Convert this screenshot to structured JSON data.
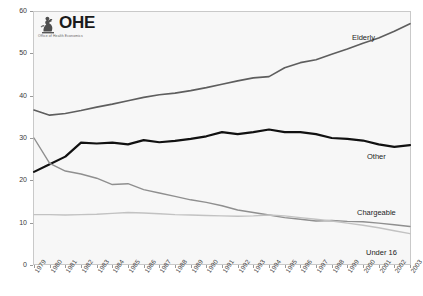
{
  "logo": {
    "wordmark": "OHE",
    "subtitle": "Office of Health Economics",
    "mark_icon": "ohe-crest-icon"
  },
  "chart_data": {
    "type": "line",
    "title": "",
    "subtitle": "",
    "xlabel": "",
    "ylabel": "",
    "ylim": [
      0,
      60
    ],
    "yticks": [
      0,
      10,
      20,
      30,
      40,
      50,
      60
    ],
    "ytick_labels": [
      "0",
      "10",
      "20",
      "30",
      "40",
      "50",
      "60"
    ],
    "grid": false,
    "legend_position": "inline-annotations",
    "categories": [
      "1979",
      "1980",
      "1981",
      "1982",
      "1983",
      "1984",
      "1985",
      "1986",
      "1987",
      "1988",
      "1989",
      "1990",
      "1991",
      "1992",
      "1993",
      "1994",
      "1995",
      "1996",
      "1997",
      "1998",
      "1999",
      "2000",
      "2001",
      "2002",
      "2003"
    ],
    "series": [
      {
        "name": "Elderly",
        "color": "#5e5e5e",
        "width": 1.6,
        "label_text": "Elderly",
        "values": [
          36.6,
          35.4,
          35.8,
          36.5,
          37.3,
          38.0,
          38.8,
          39.6,
          40.2,
          40.6,
          41.2,
          41.9,
          42.7,
          43.5,
          44.2,
          44.5,
          46.6,
          47.8,
          48.5,
          49.8,
          51.0,
          52.4,
          53.6,
          55.2,
          57.0
        ]
      },
      {
        "name": "Other",
        "color": "#111111",
        "width": 2.2,
        "label_text": "Other",
        "values": [
          22.0,
          23.8,
          25.6,
          28.9,
          28.7,
          28.9,
          28.5,
          29.5,
          29.0,
          29.3,
          29.8,
          30.4,
          31.4,
          30.9,
          31.4,
          32.0,
          31.4,
          31.4,
          30.9,
          30.0,
          29.8,
          29.4,
          28.5,
          27.9,
          28.3
        ]
      },
      {
        "name": "Chargeable",
        "color": "#8f8f8f",
        "width": 1.4,
        "label_text": "Chargeable",
        "values": [
          30.0,
          24.0,
          22.2,
          21.5,
          20.5,
          19.0,
          19.2,
          17.8,
          17.0,
          16.2,
          15.4,
          14.8,
          14.0,
          13.0,
          12.4,
          11.8,
          11.2,
          10.8,
          10.4,
          10.5,
          10.3,
          10.2,
          9.9,
          9.5,
          9.1
        ]
      },
      {
        "name": "Under 16",
        "color": "#c2c2c2",
        "width": 1.4,
        "label_text": "Under 16",
        "values": [
          11.9,
          11.9,
          11.8,
          11.9,
          12.0,
          12.2,
          12.4,
          12.3,
          12.1,
          11.9,
          11.8,
          11.7,
          11.6,
          11.5,
          11.6,
          11.8,
          11.6,
          11.2,
          10.8,
          10.4,
          9.9,
          9.4,
          8.8,
          8.1,
          7.4
        ]
      }
    ]
  }
}
